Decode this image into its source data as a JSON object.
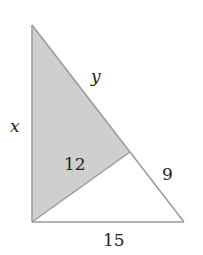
{
  "diagram": {
    "type": "right-triangle-split",
    "colors": {
      "shaded_fill": "#cfcfcf",
      "stroke": "#9a9a9a",
      "text": "#222222",
      "background": "#ffffff"
    },
    "vertices": {
      "top": [
        32,
        25
      ],
      "bottom_left": [
        32,
        222
      ],
      "bottom_right": [
        184,
        222
      ],
      "hypotenuse_point": [
        130,
        152
      ]
    },
    "labels": {
      "left_side": "x",
      "upper_hypotenuse": "y",
      "inner_segment": "12",
      "lower_hypotenuse": "9",
      "base": "15"
    }
  }
}
